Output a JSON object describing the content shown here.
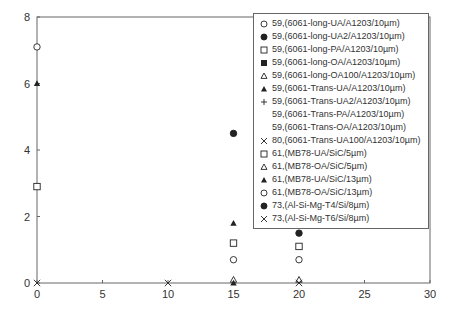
{
  "chart_data": {
    "type": "scatter",
    "title": "",
    "xlabel": "",
    "ylabel": "",
    "xlim": [
      0,
      30
    ],
    "ylim": [
      0,
      8
    ],
    "x_ticks": [
      0,
      5,
      10,
      15,
      20,
      25,
      30
    ],
    "y_ticks": [
      0,
      2,
      4,
      6,
      8
    ],
    "grid": false,
    "legend_position": "upper-right",
    "series": [
      {
        "name": "59,(6061-long-UA/A1203/10µm)",
        "marker": "open-circle",
        "points": [
          [
            0,
            7.1
          ]
        ]
      },
      {
        "name": "59,(6061-long-UA2/A1203/10µm)",
        "marker": "filled-circle",
        "points": [
          [
            15,
            4.5
          ]
        ]
      },
      {
        "name": "59,(6061-long-PA/A1203/10µm)",
        "marker": "open-square",
        "points": [
          [
            0,
            2.9
          ]
        ]
      },
      {
        "name": "59,(6061-long-OA/A1203/10µm)",
        "marker": "filled-square",
        "points": []
      },
      {
        "name": "59,(6061-long-OA100/A1203/10µm)",
        "marker": "open-triangle",
        "points": []
      },
      {
        "name": "59,(6061-Trans-UA/A1203/10µm)",
        "marker": "filled-triangle",
        "points": [
          [
            0,
            6.0
          ]
        ]
      },
      {
        "name": "59,(6061-Trans-UA2/A1203/10µm)",
        "marker": "plus",
        "points": []
      },
      {
        "name": "59,(6061-Trans-PA/A1203/10µm)",
        "marker": "none",
        "points": []
      },
      {
        "name": "59,(6061-Trans-OA/A1203/10µm)",
        "marker": "none",
        "points": []
      },
      {
        "name": "80,(6061-Trans-UA100/A1203/10µm)",
        "marker": "cross",
        "points": [
          [
            0,
            0
          ],
          [
            10,
            0
          ]
        ]
      },
      {
        "name": "61,(MB78-UA/SiC/5µm)",
        "marker": "open-square",
        "points": [
          [
            15,
            1.2
          ],
          [
            20,
            1.1
          ]
        ]
      },
      {
        "name": "61,(MB78-OA/SiC/5µm)",
        "marker": "open-triangle",
        "points": [
          [
            15,
            0.1
          ],
          [
            20,
            0.1
          ]
        ]
      },
      {
        "name": "61,(MB78-UA/SiC/13µm)",
        "marker": "filled-triangle",
        "points": [
          [
            15,
            1.8
          ],
          [
            15,
            0
          ],
          [
            20,
            1.8
          ]
        ]
      },
      {
        "name": "61,(MB78-OA/SiC/13µm)",
        "marker": "open-circle",
        "points": [
          [
            15,
            0.7
          ],
          [
            20,
            0.7
          ]
        ]
      },
      {
        "name": "73,(Al-Si-Mg-T4/Si/8µm)",
        "marker": "filled-circle",
        "points": [
          [
            20,
            1.5
          ]
        ]
      },
      {
        "name": "73,(Al-Si-Mg-T6/Si/8µm)",
        "marker": "cross",
        "points": [
          [
            20,
            0
          ]
        ]
      }
    ]
  }
}
